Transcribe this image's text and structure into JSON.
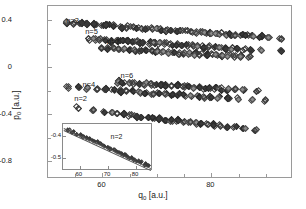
{
  "chart_data": {
    "type": "scatter",
    "title": "",
    "xlabel": "q0 [a.u.]",
    "ylabel": "p0 [a.u.]",
    "xlim": [
      50,
      95
    ],
    "ylim": [
      -0.95,
      0.52
    ],
    "xticks": [
      60,
      80
    ],
    "xticklabels": [
      "60",
      "80"
    ],
    "xticks_minor": [
      55,
      65,
      70,
      75,
      85,
      90
    ],
    "yticks": [
      0.4,
      0,
      -0.4,
      -0.8
    ],
    "yticklabels": [
      "0.4",
      "0",
      "-0.4",
      "-0.8"
    ],
    "yticks_minor": [
      0.2,
      -0.2,
      -0.6
    ],
    "grid": false,
    "legend": "none",
    "marker": "diamond",
    "annotations": [
      {
        "text": "n=3",
        "x": 54.5,
        "y": 0.4
      },
      {
        "text": "n=5",
        "x": 58.0,
        "y": 0.31
      },
      {
        "text": "n=7",
        "x": 62.0,
        "y": 0.22
      },
      {
        "text": "n=6",
        "x": 64.5,
        "y": -0.07
      },
      {
        "text": "n=4",
        "x": 57.5,
        "y": -0.14
      },
      {
        "text": "n=2",
        "x": 56.0,
        "y": -0.26
      }
    ],
    "series": [
      {
        "name": "n=3",
        "points": [
          [
            53.3,
            0.378
          ],
          [
            54.9,
            0.372
          ],
          [
            56.0,
            0.369
          ],
          [
            57.0,
            0.366
          ],
          [
            58.7,
            0.36
          ],
          [
            60.0,
            0.356
          ],
          [
            61.0,
            0.353
          ],
          [
            62.1,
            0.35
          ],
          [
            63.6,
            0.345
          ],
          [
            64.6,
            0.342
          ],
          [
            65.5,
            0.338
          ],
          [
            66.4,
            0.335
          ],
          [
            67.3,
            0.332
          ],
          [
            68.2,
            0.329
          ],
          [
            69.1,
            0.326
          ],
          [
            70.0,
            0.323
          ],
          [
            70.9,
            0.32
          ],
          [
            71.8,
            0.317
          ],
          [
            72.7,
            0.314
          ],
          [
            73.6,
            0.311
          ],
          [
            74.5,
            0.308
          ],
          [
            75.4,
            0.305
          ],
          [
            76.3,
            0.302
          ],
          [
            77.2,
            0.299
          ],
          [
            78.1,
            0.296
          ],
          [
            79.0,
            0.293
          ],
          [
            79.9,
            0.29
          ],
          [
            80.8,
            0.287
          ],
          [
            81.7,
            0.284
          ],
          [
            82.6,
            0.281
          ],
          [
            83.5,
            0.278
          ],
          [
            84.4,
            0.275
          ],
          [
            85.6,
            0.271
          ],
          [
            86.5,
            0.268
          ],
          [
            87.6,
            0.264
          ],
          [
            89.0,
            0.26
          ],
          [
            90.5,
            0.255
          ],
          [
            92.8,
            0.248
          ]
        ]
      },
      {
        "name": "n=5",
        "points": [
          [
            57.5,
            0.24
          ],
          [
            58.6,
            0.236
          ],
          [
            59.6,
            0.233
          ],
          [
            60.6,
            0.23
          ],
          [
            61.6,
            0.227
          ],
          [
            62.6,
            0.224
          ],
          [
            63.6,
            0.221
          ],
          [
            64.6,
            0.218
          ],
          [
            65.6,
            0.215
          ],
          [
            66.6,
            0.212
          ],
          [
            67.6,
            0.209
          ],
          [
            68.6,
            0.206
          ],
          [
            69.6,
            0.203
          ],
          [
            70.6,
            0.2
          ],
          [
            71.6,
            0.197
          ],
          [
            72.6,
            0.194
          ],
          [
            73.6,
            0.191
          ],
          [
            74.6,
            0.188
          ],
          [
            75.6,
            0.185
          ],
          [
            76.6,
            0.182
          ],
          [
            77.6,
            0.179
          ],
          [
            78.6,
            0.176
          ],
          [
            79.6,
            0.173
          ],
          [
            80.6,
            0.17
          ],
          [
            81.6,
            0.167
          ],
          [
            82.6,
            0.164
          ],
          [
            83.6,
            0.161
          ],
          [
            84.8,
            0.158
          ],
          [
            86.0,
            0.154
          ],
          [
            87.4,
            0.15
          ],
          [
            89.2,
            0.145
          ],
          [
            92.9,
            0.137
          ]
        ]
      },
      {
        "name": "n=7",
        "points": [
          [
            60.0,
            0.163
          ],
          [
            61.0,
            0.16
          ],
          [
            62.0,
            0.157
          ],
          [
            63.0,
            0.154
          ],
          [
            64.0,
            0.151
          ],
          [
            65.0,
            0.148
          ],
          [
            66.0,
            0.145
          ],
          [
            67.0,
            0.142
          ],
          [
            68.0,
            0.139
          ],
          [
            69.0,
            0.136
          ],
          [
            70.0,
            0.133
          ],
          [
            71.0,
            0.13
          ],
          [
            72.0,
            0.127
          ],
          [
            73.0,
            0.124
          ],
          [
            74.0,
            0.121
          ],
          [
            75.0,
            0.118
          ],
          [
            76.0,
            0.115
          ],
          [
            77.0,
            0.112
          ],
          [
            78.0,
            0.109
          ],
          [
            79.0,
            0.106
          ],
          [
            80.0,
            0.103
          ],
          [
            81.0,
            0.1
          ],
          [
            82.0,
            0.097
          ],
          [
            83.0,
            0.094
          ],
          [
            84.2,
            0.091
          ],
          [
            85.5,
            0.087
          ],
          [
            87.0,
            0.083
          ]
        ]
      },
      {
        "name": "n=6",
        "points": [
          [
            62.8,
            -0.128
          ],
          [
            63.8,
            -0.131
          ],
          [
            64.8,
            -0.134
          ],
          [
            65.8,
            -0.137
          ],
          [
            66.8,
            -0.14
          ],
          [
            67.8,
            -0.143
          ],
          [
            68.8,
            -0.146
          ],
          [
            69.8,
            -0.149
          ],
          [
            70.8,
            -0.152
          ],
          [
            71.8,
            -0.155
          ],
          [
            72.8,
            -0.158
          ],
          [
            73.8,
            -0.161
          ],
          [
            74.8,
            -0.164
          ],
          [
            75.8,
            -0.167
          ],
          [
            76.8,
            -0.17
          ],
          [
            77.8,
            -0.173
          ],
          [
            78.8,
            -0.176
          ],
          [
            79.8,
            -0.179
          ],
          [
            80.8,
            -0.182
          ],
          [
            81.8,
            -0.185
          ],
          [
            83.0,
            -0.189
          ],
          [
            84.3,
            -0.192
          ],
          [
            86.0,
            -0.197
          ],
          [
            88.5,
            -0.203
          ]
        ]
      },
      {
        "name": "n=4",
        "points": [
          [
            53.6,
            -0.172
          ],
          [
            55.6,
            -0.178
          ],
          [
            57.4,
            -0.183
          ],
          [
            59.0,
            -0.188
          ],
          [
            60.5,
            -0.192
          ],
          [
            62.0,
            -0.196
          ],
          [
            63.2,
            -0.2
          ],
          [
            64.4,
            -0.204
          ],
          [
            65.6,
            -0.208
          ],
          [
            66.8,
            -0.212
          ],
          [
            68.0,
            -0.216
          ],
          [
            69.2,
            -0.22
          ],
          [
            70.4,
            -0.224
          ],
          [
            71.6,
            -0.228
          ],
          [
            72.8,
            -0.232
          ],
          [
            74.0,
            -0.236
          ],
          [
            75.2,
            -0.24
          ],
          [
            76.4,
            -0.244
          ],
          [
            77.6,
            -0.248
          ],
          [
            78.8,
            -0.252
          ],
          [
            80.0,
            -0.256
          ],
          [
            81.4,
            -0.26
          ],
          [
            83.0,
            -0.265
          ],
          [
            85.0,
            -0.271
          ],
          [
            87.3,
            -0.278
          ],
          [
            90.0,
            -0.286
          ]
        ]
      },
      {
        "name": "n=2",
        "points": [
          [
            55.3,
            -0.345
          ],
          [
            58.5,
            -0.372
          ],
          [
            60.5,
            -0.383
          ],
          [
            61.7,
            -0.39
          ],
          [
            62.8,
            -0.396
          ],
          [
            63.9,
            -0.402
          ],
          [
            65.0,
            -0.408
          ],
          [
            66.1,
            -0.414
          ],
          [
            67.2,
            -0.42
          ],
          [
            68.3,
            -0.426
          ],
          [
            69.4,
            -0.432
          ],
          [
            70.5,
            -0.438
          ],
          [
            71.6,
            -0.444
          ],
          [
            72.7,
            -0.45
          ],
          [
            73.8,
            -0.456
          ],
          [
            74.9,
            -0.462
          ],
          [
            76.0,
            -0.468
          ],
          [
            77.1,
            -0.474
          ],
          [
            78.2,
            -0.48
          ],
          [
            79.3,
            -0.486
          ],
          [
            80.4,
            -0.492
          ],
          [
            81.5,
            -0.498
          ],
          [
            82.8,
            -0.505
          ],
          [
            84.3,
            -0.513
          ],
          [
            86.0,
            -0.522
          ],
          [
            88.0,
            -0.533
          ]
        ]
      }
    ]
  },
  "inset": {
    "label": "n=2",
    "xlabel": "",
    "ylabel": "",
    "xlim": [
      54,
      86
    ],
    "ylim": [
      -0.56,
      -0.345
    ],
    "xticks": [
      60,
      70,
      80
    ],
    "xticklabels": [
      "60",
      "70",
      "80"
    ],
    "yticks": [
      -0.4,
      -0.5
    ],
    "yticklabels": [
      "-0.4",
      "-0.5"
    ],
    "fit_lines": [
      {
        "x1": 54.5,
        "y1": -0.362,
        "x2": 85.5,
        "y2": -0.546
      },
      {
        "x1": 54.5,
        "y1": -0.372,
        "x2": 85.5,
        "y2": -0.556
      }
    ],
    "points": [
      [
        56.0,
        -0.372
      ],
      [
        57.5,
        -0.381
      ],
      [
        59.0,
        -0.39
      ],
      [
        60.2,
        -0.397
      ],
      [
        61.4,
        -0.404
      ],
      [
        62.6,
        -0.411
      ],
      [
        63.8,
        -0.418
      ],
      [
        65.0,
        -0.425
      ],
      [
        66.2,
        -0.432
      ],
      [
        67.4,
        -0.439
      ],
      [
        68.6,
        -0.446
      ],
      [
        69.8,
        -0.453
      ],
      [
        71.0,
        -0.46
      ],
      [
        72.2,
        -0.467
      ],
      [
        73.4,
        -0.474
      ],
      [
        74.6,
        -0.481
      ],
      [
        75.8,
        -0.488
      ],
      [
        77.0,
        -0.495
      ],
      [
        78.2,
        -0.502
      ],
      [
        79.4,
        -0.509
      ],
      [
        80.6,
        -0.516
      ],
      [
        81.8,
        -0.523
      ],
      [
        83.0,
        -0.53
      ],
      [
        84.2,
        -0.537
      ]
    ]
  },
  "colors": {
    "axis": "#9a9a9a",
    "marker_edge": "#3b3b3b",
    "marker_fill_dark": "#3a3a3a",
    "marker_fill_mid": "#8c8c8c",
    "background": "#ffffff",
    "text": "#1a1a1a"
  }
}
